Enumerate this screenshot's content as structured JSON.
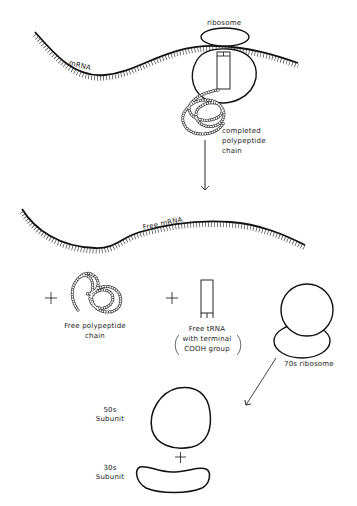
{
  "diagram": {
    "stroke_color": "#111111",
    "background": "#ffffff",
    "top_panel": {
      "mrna_label": "mRNA",
      "ribosome_label": "ribosome",
      "chain_label_line1": "completed",
      "chain_label_line2": "polypeptide",
      "chain_label_line3": "chain"
    },
    "middle_panel": {
      "free_mrna_label": "Free mRNA",
      "plus_symbol": "+",
      "polypeptide_label_line1": "Free polypeptide",
      "polypeptide_label_line2": "chain",
      "trna_label_line1": "Free tRNA",
      "trna_label_line2": "with terminal",
      "trna_label_line3": "COOH group",
      "ribosome_70s_label": "70s ribosome"
    },
    "bottom_panel": {
      "subunit_50s_line1": "50s",
      "subunit_50s_line2": "Subunit",
      "subunit_30s_line1": "30s",
      "subunit_30s_line2": "Subunit",
      "plus_symbol": "+"
    }
  }
}
